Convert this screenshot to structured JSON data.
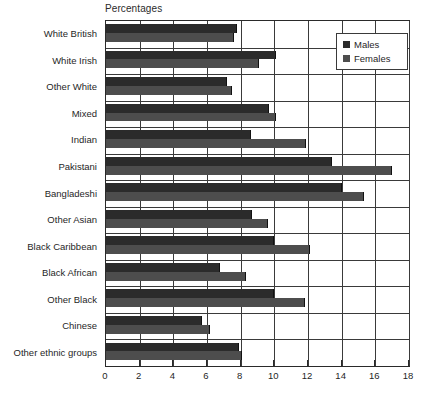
{
  "chart_data": {
    "type": "bar",
    "orientation": "horizontal",
    "title": "Percentages",
    "xlabel": "",
    "ylabel": "",
    "xlim": [
      0,
      18
    ],
    "xticks": [
      0,
      2,
      4,
      6,
      8,
      10,
      12,
      14,
      16,
      18
    ],
    "grid": true,
    "grid_axis": "x",
    "legend_position": "top-right",
    "categories": [
      "White British",
      "White Irish",
      "Other White",
      "Mixed",
      "Indian",
      "Pakistani",
      "Bangladeshi",
      "Other Asian",
      "Black Caribbean",
      "Black African",
      "Other Black",
      "Chinese",
      "Other ethnic groups"
    ],
    "series": [
      {
        "name": "Males",
        "color": "#2b2b2b",
        "values": [
          7.8,
          10.1,
          7.2,
          9.7,
          8.6,
          13.4,
          14.0,
          8.7,
          10.0,
          6.8,
          10.0,
          5.7,
          7.9
        ]
      },
      {
        "name": "Females",
        "color": "#4d4d4d",
        "values": [
          7.6,
          9.1,
          7.5,
          10.1,
          11.9,
          17.0,
          15.3,
          9.6,
          12.1,
          8.3,
          11.8,
          6.2,
          8.1
        ]
      }
    ]
  },
  "legend": {
    "entries": [
      {
        "label": "Males"
      },
      {
        "label": "Females"
      }
    ]
  }
}
